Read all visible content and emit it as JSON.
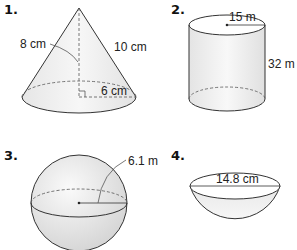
{
  "figures": [
    {
      "number": "1.",
      "shape": "cone",
      "labels": {
        "height": "8 cm",
        "slant": "10 cm",
        "radius": "6 cm"
      }
    },
    {
      "number": "2.",
      "shape": "cylinder",
      "labels": {
        "radius": "15 m",
        "height": "32 m"
      }
    },
    {
      "number": "3.",
      "shape": "sphere",
      "labels": {
        "radius": "6.1 m"
      }
    },
    {
      "number": "4.",
      "shape": "hemisphere",
      "labels": {
        "diameter": "14.8 cm"
      }
    }
  ],
  "colors": {
    "stroke": "#333333",
    "fill_light": "#f2f2f2",
    "fill_mid": "#dcdcdc"
  }
}
